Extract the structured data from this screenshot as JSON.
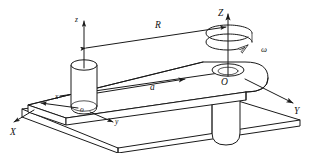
{
  "figure": {
    "background_color": "#ffffff",
    "line_color": "#1a1a1a"
  },
  "labels": {
    "global_x": "X",
    "global_y": "Y",
    "global_z": "Z",
    "global_origin": "O",
    "local_x": "x",
    "local_y": "y",
    "local_z": "z",
    "local_origin": "o",
    "radius": "R",
    "acceleration": "a",
    "angular_velocity": "ω"
  },
  "elements": {
    "beam_name": "horizontal-arm",
    "left_cylinder_name": "left-cylinder-mass",
    "right_hole_name": "rotation-axis-hole",
    "support_post_name": "support-post",
    "base_plate_name": "base-plate",
    "rotation_arrow_name": "rotation-spiral-arrow",
    "radius_dimension_name": "radius-dimension-line",
    "acceleration_vector_name": "acceleration-vector"
  }
}
